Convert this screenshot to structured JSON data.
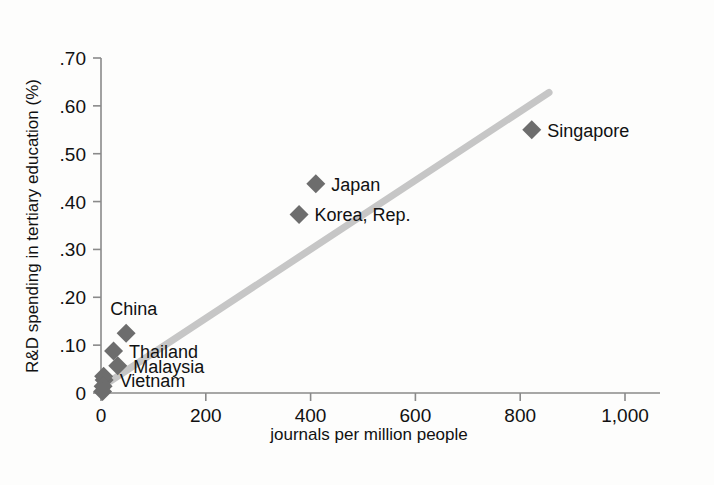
{
  "chart_data": {
    "type": "scatter",
    "title": "",
    "xlabel": "journals per million people",
    "ylabel": "R&D spending in tertiary education (%)",
    "xlim": [
      0,
      1000
    ],
    "ylim": [
      0,
      0.7
    ],
    "xticks": [
      0,
      200,
      400,
      600,
      800,
      1000
    ],
    "xticklabels": [
      "0",
      "200",
      "400",
      "600",
      "800",
      "1,000"
    ],
    "yticks": [
      0,
      0.1,
      0.2,
      0.3,
      0.4,
      0.5,
      0.6,
      0.7
    ],
    "yticklabels": [
      "0",
      ".10",
      ".20",
      ".30",
      ".40",
      ".50",
      ".60",
      ".70"
    ],
    "grid": false,
    "legend": "none",
    "points": [
      {
        "name": "Singapore",
        "x": 822,
        "y": 0.55,
        "label": "Singapore",
        "label_pos": "right"
      },
      {
        "name": "Japan",
        "x": 410,
        "y": 0.437,
        "label": "Japan",
        "label_pos": "right"
      },
      {
        "name": "Korea, Rep.",
        "x": 378,
        "y": 0.373,
        "label": "Korea, Rep.",
        "label_pos": "right"
      },
      {
        "name": "China",
        "x": 48,
        "y": 0.125,
        "label": "China",
        "label_pos": "above"
      },
      {
        "name": "Thailand",
        "x": 24,
        "y": 0.088,
        "label": "Thailand",
        "label_pos": "right"
      },
      {
        "name": "Malaysia",
        "x": 32,
        "y": 0.057,
        "label": "Malaysia",
        "label_pos": "right"
      },
      {
        "name": "Vietnam",
        "x": 6,
        "y": 0.027,
        "label": "Vietnam",
        "label_pos": "right"
      },
      {
        "name": "unlabeled-1",
        "x": 5,
        "y": 0.035,
        "label": "",
        "label_pos": "none"
      },
      {
        "name": "unlabeled-2",
        "x": 4,
        "y": 0.014,
        "label": "",
        "label_pos": "none"
      },
      {
        "name": "unlabeled-3",
        "x": 3,
        "y": 0.003,
        "label": "",
        "label_pos": "none"
      }
    ],
    "trendline": {
      "x_start": 0,
      "y_start": 0.012,
      "x_end": 855,
      "y_end": 0.628,
      "color": "#c6c6c6"
    },
    "marker_color": "#6d6d6d",
    "marker_shape": "diamond",
    "axis_color": "#8a8a8a",
    "background_color": "#fdfdfc"
  }
}
